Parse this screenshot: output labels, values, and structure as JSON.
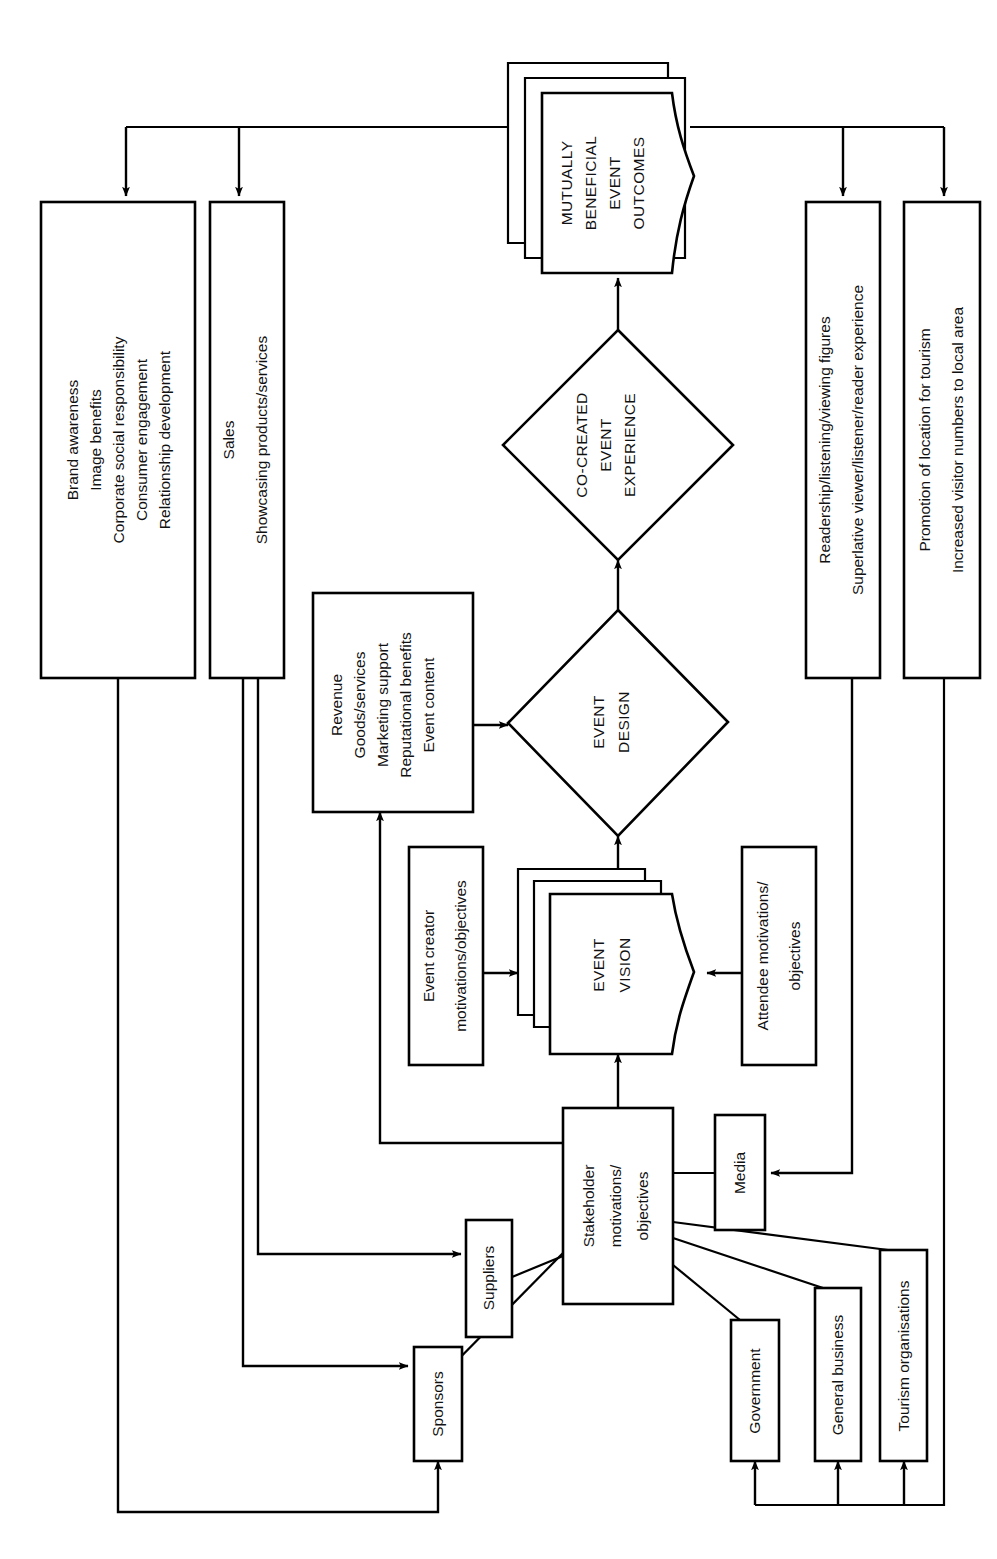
{
  "diagram": {
    "orientation": "rotated-90-ccw",
    "colors": {
      "stroke": "#000000",
      "fill": "#ffffff",
      "text": "#111111"
    },
    "nodes": {
      "outcomes": {
        "label_lines": [
          "MUTUALLY",
          "BENEFICIAL",
          "EVENT",
          "OUTCOMES"
        ],
        "shape": "stacked-document"
      },
      "co_created": {
        "label_lines": [
          "CO-CREATED",
          "EVENT",
          "EXPERIENCE"
        ],
        "shape": "diamond"
      },
      "event_design": {
        "label_lines": [
          "EVENT",
          "DESIGN"
        ],
        "shape": "diamond"
      },
      "event_vision": {
        "label_lines": [
          "EVENT",
          "VISION"
        ],
        "shape": "stacked-document"
      },
      "sponsor_benefits": {
        "label_lines": [
          "Brand awareness",
          "Image benefits",
          "Corporate social responsibility",
          "Consumer engagement",
          "Relationship development"
        ],
        "shape": "rect"
      },
      "supplier_benefits": {
        "label_lines": [
          "Sales",
          "Showcasing products/services"
        ],
        "shape": "rect"
      },
      "media_benefits": {
        "label_lines": [
          "Readership/listening/viewing figures",
          "Superlative viewer/listener/reader experience"
        ],
        "shape": "rect"
      },
      "tourism_benefits": {
        "label_lines": [
          "Promotion of location for tourism",
          "Increased visitor numbers to local area"
        ],
        "shape": "rect"
      },
      "event_inputs": {
        "label_lines": [
          "Revenue",
          "Goods/services",
          "Marketing support",
          "Reputational benefits",
          "Event content"
        ],
        "shape": "rect"
      },
      "event_creator": {
        "label_lines": [
          "Event creator",
          "motivations/objectives"
        ],
        "shape": "rect"
      },
      "attendee": {
        "label_lines": [
          "Attendee motivations/",
          "objectives"
        ],
        "shape": "rect"
      },
      "stakeholder_hub": {
        "label_lines": [
          "Stakeholder",
          "motivations/",
          "objectives"
        ],
        "shape": "rect"
      },
      "suppliers": {
        "label_lines": [
          "Suppliers"
        ],
        "shape": "rect"
      },
      "sponsors": {
        "label_lines": [
          "Sponsors"
        ],
        "shape": "rect"
      },
      "media": {
        "label_lines": [
          "Media"
        ],
        "shape": "rect"
      },
      "government": {
        "label_lines": [
          "Government"
        ],
        "shape": "rect"
      },
      "general_business": {
        "label_lines": [
          "General business"
        ],
        "shape": "rect"
      },
      "tourism_orgs": {
        "label_lines": [
          "Tourism organisations"
        ],
        "shape": "rect"
      }
    },
    "edges": [
      {
        "from": "event_inputs",
        "to": "event_design",
        "arrow": true
      },
      {
        "from": "event_vision",
        "to": "event_design",
        "arrow": true
      },
      {
        "from": "event_design",
        "to": "co_created",
        "arrow": true
      },
      {
        "from": "co_created",
        "to": "outcomes",
        "arrow": true
      },
      {
        "from": "event_creator",
        "to": "event_vision",
        "arrow": true
      },
      {
        "from": "attendee",
        "to": "event_vision",
        "arrow": true
      },
      {
        "from": "stakeholder_hub",
        "to": "event_vision",
        "arrow": true
      },
      {
        "from": "stakeholder_hub",
        "to": "event_inputs",
        "arrow": true
      },
      {
        "from": "outcomes",
        "to": "sponsor_benefits",
        "arrow": true
      },
      {
        "from": "outcomes",
        "to": "supplier_benefits",
        "arrow": true
      },
      {
        "from": "outcomes",
        "to": "media_benefits",
        "arrow": true
      },
      {
        "from": "outcomes",
        "to": "tourism_benefits",
        "arrow": true
      },
      {
        "from": "sponsor_benefits",
        "to": "sponsors",
        "arrow": true
      },
      {
        "from": "supplier_benefits",
        "to": "suppliers",
        "arrow": true
      },
      {
        "from": "supplier_benefits",
        "to": "sponsors",
        "arrow": true
      },
      {
        "from": "media_benefits",
        "to": "media",
        "arrow": true
      },
      {
        "from": "tourism_benefits",
        "to": "government",
        "arrow": true
      },
      {
        "from": "tourism_benefits",
        "to": "general_business",
        "arrow": true
      },
      {
        "from": "tourism_benefits",
        "to": "tourism_orgs",
        "arrow": true
      },
      {
        "from": "suppliers",
        "to": "stakeholder_hub",
        "arrow": false
      },
      {
        "from": "sponsors",
        "to": "stakeholder_hub",
        "arrow": false
      },
      {
        "from": "media",
        "to": "stakeholder_hub",
        "arrow": false
      },
      {
        "from": "government",
        "to": "stakeholder_hub",
        "arrow": false
      },
      {
        "from": "general_business",
        "to": "stakeholder_hub",
        "arrow": false
      },
      {
        "from": "tourism_orgs",
        "to": "stakeholder_hub",
        "arrow": false
      }
    ]
  }
}
